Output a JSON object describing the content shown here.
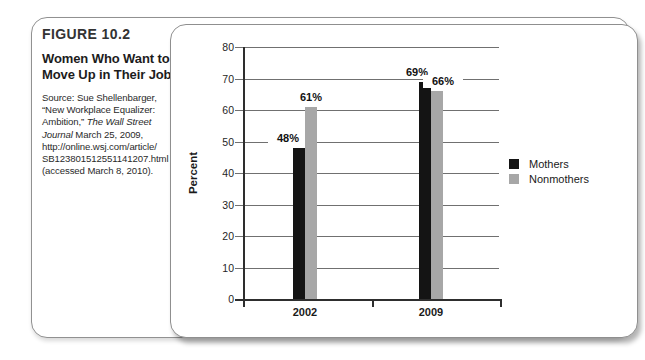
{
  "figure": {
    "label": "FIGURE 10.2",
    "title_lines": [
      "Women Who Want to",
      "Move Up in Their Jobs"
    ],
    "source_lines": [
      [
        {
          "t": "Source: Sue Shellenbarger,"
        }
      ],
      [
        {
          "t": "“New Workplace Equalizer:"
        }
      ],
      [
        {
          "t": "Ambition,” "
        },
        {
          "t": "The Wall Street",
          "i": true
        }
      ],
      [
        {
          "t": "Journal ",
          "i": true
        },
        {
          "t": "March 25, 2009,"
        }
      ],
      [
        {
          "t": "http://online.wsj.com/article/"
        }
      ],
      [
        {
          "t": "SB123801512551141207.html"
        }
      ],
      [
        {
          "t": "(accessed March 8, 2010)."
        }
      ]
    ]
  },
  "chart_data": {
    "type": "bar",
    "categories": [
      "2002",
      "2009"
    ],
    "series": [
      {
        "name": "Mothers",
        "color": "#141414",
        "values": [
          48,
          69
        ],
        "labels": [
          "48%",
          "69%"
        ]
      },
      {
        "name": "Nonmothers",
        "color": "#a7a7a7",
        "values": [
          61,
          66
        ],
        "labels": [
          "61%",
          "66%"
        ]
      }
    ],
    "title": "",
    "xlabel": "",
    "ylabel": "Percent",
    "ylim": [
      0,
      80
    ],
    "ytick_step": 10,
    "yticks": [
      0,
      10,
      20,
      30,
      40,
      50,
      60,
      70,
      80
    ],
    "grid": true,
    "legend": {
      "position": "right",
      "entries": [
        "Mothers",
        "Nonmothers"
      ]
    }
  },
  "colors": {
    "bar_mothers": "#141414",
    "bar_nonmothers": "#a7a7a7",
    "panel_border": "#8f8f8f",
    "gridline": "#707070",
    "text": "#1a1a1a"
  }
}
